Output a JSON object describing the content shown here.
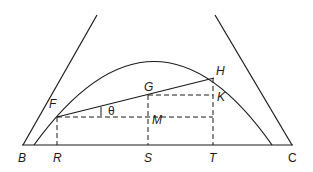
{
  "diagram": {
    "labels": {
      "B": "B",
      "R": "R",
      "S": "S",
      "T": "T",
      "C": "C",
      "F": "F",
      "G": "G",
      "H": "H",
      "K": "K",
      "M": "M",
      "theta": "θ"
    }
  }
}
